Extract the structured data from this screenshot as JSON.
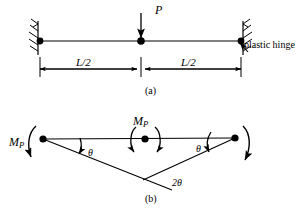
{
  "figure": {
    "panels": [
      {
        "id": "a",
        "caption": "(a)",
        "load_label": "P",
        "dimension_left": "L/2",
        "dimension_right": "L/2",
        "annotation": "plastic hinge"
      },
      {
        "id": "b",
        "caption": "(b)",
        "moment_left": "M",
        "moment_left_sub": "P",
        "moment_center": "M",
        "moment_center_sub": "P",
        "angle_left": "θ",
        "angle_right": "θ",
        "angle_center": "2θ"
      }
    ],
    "colors": {
      "ink": "#000000",
      "background": "#ffffff"
    }
  }
}
